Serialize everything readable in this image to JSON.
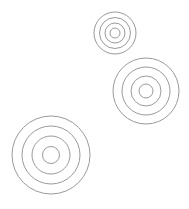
{
  "canvas": {
    "width": 189,
    "height": 209,
    "background": "#ffffff"
  },
  "style": {
    "stroke_color": "#9a9a9a",
    "stroke_width": 1
  },
  "targets": [
    {
      "name": "target-top",
      "cx": 115,
      "cy": 33,
      "radii": [
        21,
        15.5,
        10,
        5
      ]
    },
    {
      "name": "target-middle",
      "cx": 146,
      "cy": 91,
      "radii": [
        33,
        24,
        15,
        7
      ]
    },
    {
      "name": "target-bottom-left",
      "cx": 51,
      "cy": 155,
      "radii": [
        39,
        29,
        19,
        8.5
      ]
    }
  ]
}
